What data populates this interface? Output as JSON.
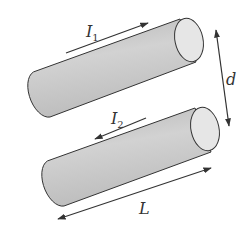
{
  "diagram": {
    "wires": [
      {
        "id": "wire-1",
        "current_label": "I",
        "current_subscript": "1",
        "current_direction": "right-up"
      },
      {
        "id": "wire-2",
        "current_label": "I",
        "current_subscript": "2",
        "current_direction": "left-down"
      }
    ],
    "dimensions": {
      "separation_label": "d",
      "length_label": "L"
    },
    "colors": {
      "line": "#333333",
      "cylinder_body": "#c8c8c8",
      "cylinder_cap": "#e6e6e6",
      "background": "#ffffff"
    }
  }
}
